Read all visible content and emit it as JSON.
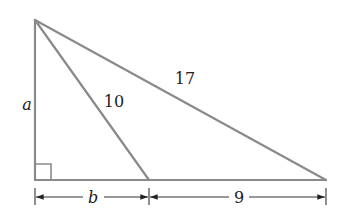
{
  "diagram": {
    "colors": {
      "line": "#8a8a8a",
      "text": "#222222",
      "background": "#ffffff"
    },
    "vertices": {
      "top": [
        35,
        20
      ],
      "bottom_left": [
        35,
        180
      ],
      "foot": [
        149,
        180
      ],
      "bottom_right": [
        326,
        180
      ]
    },
    "labels": {
      "left_side": "a",
      "cevian": "10",
      "hypotenuse": "17",
      "base_left": "b",
      "base_right": "9"
    },
    "right_angle_marker": true
  }
}
